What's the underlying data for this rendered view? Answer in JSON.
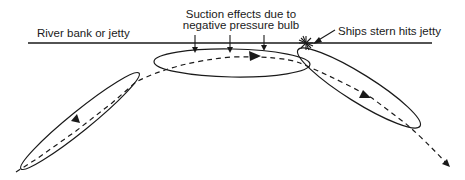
{
  "diagram": {
    "type": "ship-bank-interaction",
    "labels": {
      "bank": "River bank or jetty",
      "suction_line1": "Suction effects due to",
      "suction_line2": "negative pressure bulb",
      "impact": "Ships stern hits jetty"
    },
    "elements": {
      "bank_line": "solid horizontal line",
      "ship_positions": 3,
      "track": "dashed curved path with direction arrows",
      "suction_arrows": 3,
      "impact_marker": "star-burst"
    },
    "colors": {
      "ink": "#1a1a1a",
      "background": "#ffffff"
    }
  }
}
